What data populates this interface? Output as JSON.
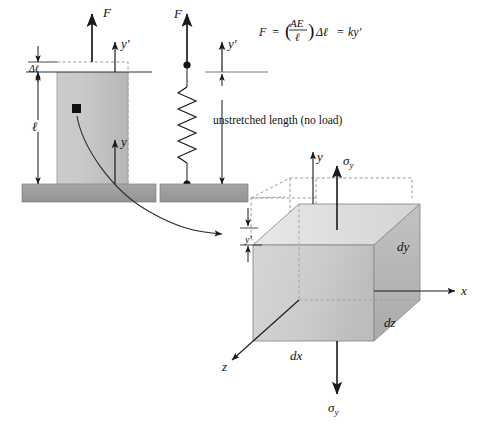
{
  "figure": {
    "background_color": "#ffffff",
    "ink_color": "#1a1a1a"
  },
  "colors": {
    "column_fill": "#c6c6c6",
    "slab_fill": "#9a9a9a",
    "block_front_fill": "#cfcfcf",
    "block_top_fill": "#e3e3e3",
    "block_side_fill": "#b4b4b4",
    "dashed_line": "#8f8f8f",
    "ink": "#1a1a1a"
  },
  "column_diagram": {
    "name": "loaded-column",
    "force_label": "F",
    "delta_label": "Δℓ",
    "length_label": "ℓ",
    "axis_primed_label": "y′",
    "axis_label": "y",
    "element_marker_label": "stress-element-marker"
  },
  "spring_diagram": {
    "name": "equivalent-spring",
    "force_label": "F",
    "axis_primed_label": "y′",
    "caption": "unstretched length (no load)"
  },
  "equation": {
    "lhs": "F",
    "equals1": "=",
    "paren_open": "(",
    "numerator": "AE",
    "denominator": "ℓ",
    "paren_close": ")",
    "delta_term": "Δℓ",
    "equals2": "=",
    "rhs": "ky′",
    "plain": "F = (AE/ℓ)Δℓ = ky′"
  },
  "stress_element": {
    "name": "differential-stress-element",
    "stress_top_label": "σ",
    "stress_top_sub": "y",
    "stress_bottom_label": "σ",
    "stress_bottom_sub": "y",
    "axis_y_label": "y",
    "axis_x_label": "x",
    "axis_z_label": "z",
    "dim_dx": "dx",
    "dim_dy": "dy",
    "dim_dz": "dz",
    "deflection_label": "y′"
  }
}
